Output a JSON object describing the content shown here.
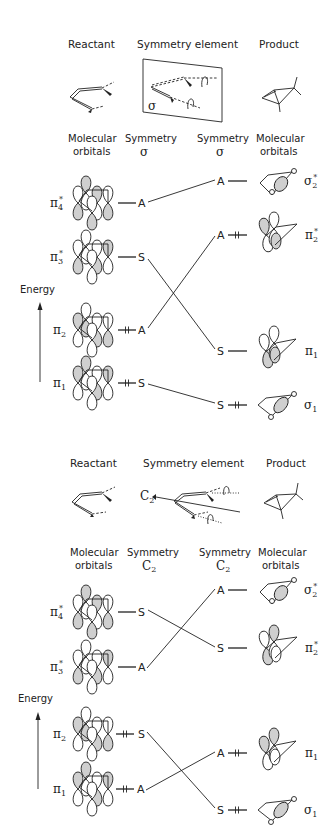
{
  "panel_top": {
    "headers": {
      "reactant": "Reactant",
      "symmetry_element": "Symmetry element",
      "product": "Product"
    },
    "mirror_label": "σ",
    "column_headers": {
      "left_mo_line1": "Molecular",
      "left_mo_line2": "orbitals",
      "left_sym_line1": "Symmetry",
      "left_sym_line2": "σ",
      "right_sym_line1": "Symmetry",
      "right_sym_line2": "σ",
      "right_mo_line1": "Molecular",
      "right_mo_line2": "orbitals"
    },
    "energy_label": "Energy",
    "reactant_orbitals": [
      {
        "name": "π",
        "sub": "4",
        "star": "*",
        "symmetry": "A",
        "occupied": false
      },
      {
        "name": "π",
        "sub": "3",
        "star": "*",
        "symmetry": "S",
        "occupied": false
      },
      {
        "name": "π",
        "sub": "2",
        "star": "",
        "symmetry": "A",
        "occupied": true
      },
      {
        "name": "π",
        "sub": "1",
        "star": "",
        "symmetry": "S",
        "occupied": true
      }
    ],
    "product_orbitals": [
      {
        "name": "σ",
        "sub": "2",
        "star": "*",
        "symmetry": "A",
        "occupied": false
      },
      {
        "name": "π",
        "sub": "2",
        "star": "*",
        "symmetry": "A",
        "occupied": true
      },
      {
        "name": "π",
        "sub": "1",
        "star": "",
        "symmetry": "S",
        "occupied": false
      },
      {
        "name": "σ",
        "sub": "1",
        "star": "",
        "symmetry": "S",
        "occupied": true
      }
    ],
    "correlations": [
      [
        "π4*",
        "σ2*"
      ],
      [
        "π3*",
        "π1"
      ],
      [
        "π2",
        "π2*"
      ],
      [
        "π1",
        "σ1"
      ]
    ]
  },
  "panel_bottom": {
    "headers": {
      "reactant": "Reactant",
      "symmetry_element": "Symmetry element",
      "product": "Product"
    },
    "axis_label": "C",
    "axis_sub": "2",
    "column_headers": {
      "left_mo_line1": "Molecular",
      "left_mo_line2": "orbitals",
      "left_sym_line1": "Symmetry",
      "left_sym_line2": "C",
      "left_sym_sub": "2",
      "right_sym_line1": "Symmetry",
      "right_sym_line2": "C",
      "right_sym_sub": "2",
      "right_mo_line1": "Molecular",
      "right_mo_line2": "orbitals"
    },
    "energy_label": "Energy",
    "reactant_orbitals": [
      {
        "name": "π",
        "sub": "4",
        "star": "*",
        "symmetry": "S",
        "occupied": false
      },
      {
        "name": "π",
        "sub": "3",
        "star": "*",
        "symmetry": "A",
        "occupied": false
      },
      {
        "name": "π",
        "sub": "2",
        "star": "",
        "symmetry": "S",
        "occupied": true
      },
      {
        "name": "π",
        "sub": "1",
        "star": "",
        "symmetry": "A",
        "occupied": true
      }
    ],
    "product_orbitals": [
      {
        "name": "σ",
        "sub": "2",
        "star": "*",
        "symmetry": "A",
        "occupied": false
      },
      {
        "name": "π",
        "sub": "2",
        "star": "*",
        "symmetry": "S",
        "occupied": false
      },
      {
        "name": "π",
        "sub": "1",
        "star": "",
        "symmetry": "A",
        "occupied": true
      },
      {
        "name": "σ",
        "sub": "1",
        "star": "",
        "symmetry": "S",
        "occupied": true
      }
    ],
    "correlations": [
      [
        "π4*",
        "π2*"
      ],
      [
        "π3*",
        "σ2*"
      ],
      [
        "π2",
        "σ1"
      ],
      [
        "π1",
        "π1"
      ]
    ]
  }
}
